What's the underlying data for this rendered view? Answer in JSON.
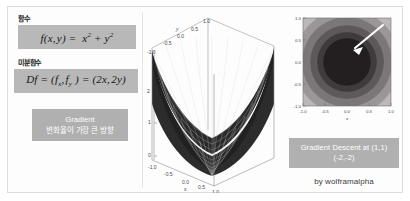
{
  "left_panel": {
    "function_label": "함수",
    "function_equation": "f(x, y) = x² + y²",
    "derivative_label": "미분함수",
    "derivative_equation": "Df = (fₓ, fᵧ ) = (2x, 2y)",
    "gradient_box": {
      "title": "Gradient",
      "subtitle": "변화율이 가장 큰 방향"
    }
  },
  "plot3d": {
    "type": "surface",
    "function": "f(x,y) = x^2 + y^2",
    "xlabel": "x",
    "ylabel": "y",
    "x_ticks": [
      "-1.0",
      "-0.5",
      "0.0",
      "0.5",
      "1.0"
    ],
    "y_ticks": [
      "-1.0",
      "-0.5",
      "0.0",
      "0.5",
      "1.0"
    ],
    "z_ticks": [
      "0",
      "1",
      "2"
    ],
    "xlim": [
      -1.0,
      1.0
    ],
    "ylim": [
      -1.0,
      1.0
    ],
    "zlim": [
      0,
      2
    ],
    "surface_color": "#2b2b2b",
    "mesh_color": "#ffffff"
  },
  "contour": {
    "type": "contour",
    "function": "f(x,y) = x^2 + y^2",
    "xlabel": "x",
    "ylabel": "y",
    "x_ticks": [
      "-1.0",
      "-0.5",
      "0.0",
      "0.5",
      "1.0"
    ],
    "y_ticks": [
      "-1.0",
      "-0.5",
      "0.0",
      "0.5",
      "1.0"
    ],
    "xlim": [
      -1.0,
      1.0
    ],
    "ylim": [
      -1.0,
      1.0
    ],
    "levels": [
      0.25,
      0.5,
      0.75,
      1.0,
      1.25,
      1.5,
      2.0
    ],
    "band_colors": [
      "#231f20",
      "#3f3b3c",
      "#5d595a",
      "#7b7778",
      "#9b9798",
      "#bcb8b9",
      "#d8d5d6"
    ],
    "arrow": {
      "color": "#ffffff",
      "from_point": [
        0.85,
        0.82
      ],
      "to_point": [
        0.28,
        0.4
      ]
    }
  },
  "right_panel": {
    "caption_line1": "Gradient Descent at (1,1)",
    "caption_line2": "(-2,-2)",
    "credit": "by wolframalpha"
  },
  "colors": {
    "box_gray": "#b8b8b8",
    "caption_gray": "#b0b0b0",
    "frame": "#dcdcdc",
    "background": "#ffffff"
  }
}
